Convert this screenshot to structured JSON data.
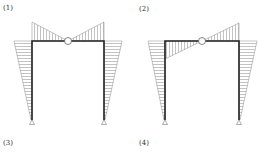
{
  "labels": {
    "opt1": "(1)",
    "opt2": "(2)",
    "opt3": "(3)",
    "opt4": "(4)"
  },
  "colors": {
    "frame": "#222222",
    "hatch": "#999999",
    "outline": "#888888"
  },
  "frames": [
    {
      "id": "1",
      "left_col_x": 32,
      "right_col_x": 104,
      "beam_y": 41,
      "base_y": 120,
      "hinge_x": 68,
      "beam_diagram": "both ends above beam, zero at hinge",
      "left_col_top_offset": -18,
      "right_col_top_offset": 18
    },
    {
      "id": "2",
      "left_col_x": 165,
      "right_col_x": 239,
      "beam_y": 41,
      "base_y": 120,
      "hinge_x": 202,
      "beam_diagram": "left below beam, right above beam, zero at hinge",
      "left_col_top_offset": -17,
      "right_col_top_offset": 18
    }
  ]
}
